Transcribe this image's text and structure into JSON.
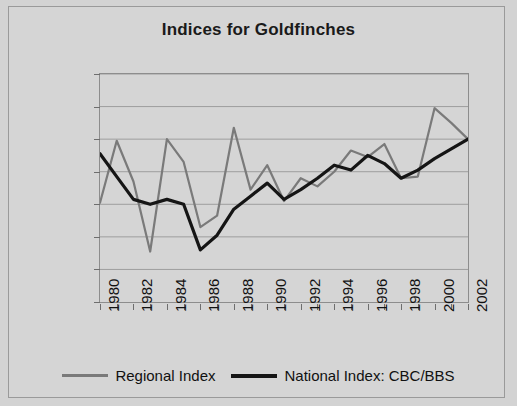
{
  "chart_data": {
    "type": "line",
    "title": "Indices for Goldfinches",
    "xlabel": "",
    "ylabel": "Index: 2002=100",
    "ylim": [
      0,
      140
    ],
    "ytick_values": [
      0,
      20,
      40,
      60,
      80,
      100,
      120,
      140
    ],
    "xlim": [
      1980,
      2002
    ],
    "xtick_labels": [
      "1980",
      "1982",
      "1984",
      "1986",
      "1988",
      "1990",
      "1992",
      "1994",
      "1996",
      "1998",
      "2000",
      "2002"
    ],
    "xtick_values": [
      1980,
      1982,
      1984,
      1986,
      1988,
      1990,
      1992,
      1994,
      1996,
      1998,
      2000,
      2002
    ],
    "minor_xticks_every": 1,
    "grid": "horizontal",
    "legend_position": "bottom",
    "x": [
      1980,
      1981,
      1982,
      1983,
      1984,
      1985,
      1986,
      1987,
      1988,
      1989,
      1990,
      1991,
      1992,
      1993,
      1994,
      1995,
      1996,
      1997,
      1998,
      1999,
      2000,
      2001,
      2002
    ],
    "series": [
      {
        "name": "Regional Index",
        "color": "#7a7a7a",
        "values": [
          61,
          99,
          74,
          31,
          100,
          86,
          46,
          53,
          107,
          69,
          84,
          62,
          76,
          71,
          80,
          93,
          89,
          97,
          76,
          77,
          119,
          110,
          100
        ]
      },
      {
        "name": "National Index: CBC/BBS",
        "color": "#151515",
        "values": [
          91,
          77,
          63,
          60,
          63,
          60,
          32,
          41,
          57,
          65,
          73,
          63,
          69,
          76,
          84,
          81,
          90,
          85,
          76,
          81,
          88,
          94,
          100
        ]
      }
    ]
  },
  "legend": {
    "items": [
      {
        "label": "Regional Index",
        "swatch": "regional-line-swatch"
      },
      {
        "label": "National Index: CBC/BBS",
        "swatch": "national-line-swatch"
      }
    ]
  }
}
